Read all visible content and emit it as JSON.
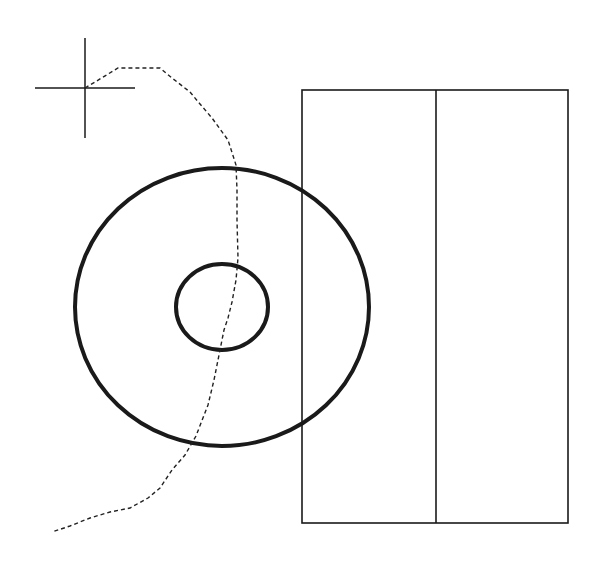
{
  "canvas": {
    "width": 608,
    "height": 570,
    "background": "#ffffff"
  },
  "colors": {
    "stroke": "#1a1a1a",
    "path": "#222222"
  },
  "crosshair": {
    "cx": 85,
    "cy": 88,
    "arm_h": 50,
    "arm_v": 50
  },
  "outer_circle": {
    "cx": 222,
    "cy": 307,
    "rx": 147,
    "ry": 139,
    "stroke_width": 4
  },
  "inner_circle": {
    "cx": 222,
    "cy": 307,
    "rx": 46,
    "ry": 43,
    "stroke_width": 4
  },
  "rectangle": {
    "x": 302,
    "y": 90,
    "width": 266,
    "height": 433,
    "divider_x": 436
  },
  "dashed_path": {
    "points": "85,88 95,82 118,68 160,68 172,78 190,92 200,104 212,118 228,140 236,165 237,190 237,220 238,258 236,280 232,302 228,318 224,330 220,350 214,380 208,405 196,436 185,455 172,470 160,488 148,498 130,508 110,512 90,518 70,526 52,532"
  }
}
